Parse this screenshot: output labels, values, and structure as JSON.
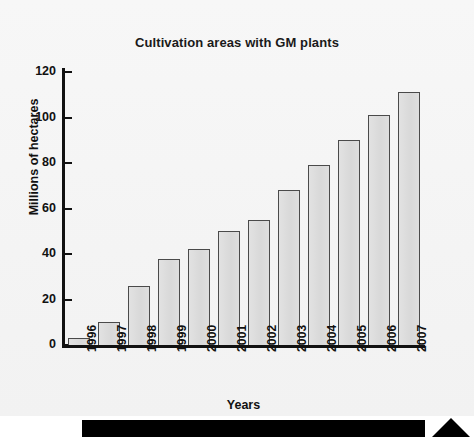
{
  "chart_data": {
    "type": "bar",
    "title": "Cultivation areas with GM plants",
    "xlabel": "Years",
    "ylabel": "Millions of hectares",
    "categories": [
      "1996",
      "1997",
      "1998",
      "1999",
      "2000",
      "2001",
      "2002",
      "2003",
      "2004",
      "2005",
      "2006",
      "2007"
    ],
    "values": [
      3,
      10,
      26,
      38,
      42,
      50,
      55,
      68,
      79,
      90,
      101,
      111
    ],
    "ylim": [
      0,
      120
    ],
    "yticks": [
      0,
      20,
      40,
      60,
      80,
      100,
      120
    ],
    "ytick_labels": [
      "0",
      "20",
      "40",
      "60",
      "80",
      "100",
      "120"
    ],
    "grid": false,
    "legend": false,
    "bar_fill_color": "#dcdcdc",
    "bar_edge_color": "#4a4a4a",
    "axis_color": "#111111",
    "background_color": "#f4f4f4"
  },
  "figure": {
    "background_color": "#f4f4f4"
  },
  "footer": {
    "bar_color": "#000000",
    "arrow_icon": "triangle-up-icon",
    "arrow_color": "#000000"
  }
}
